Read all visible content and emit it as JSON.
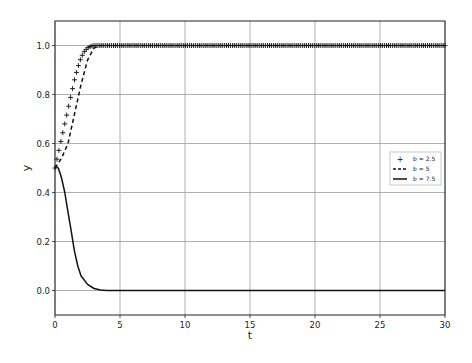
{
  "chart_data": {
    "type": "line",
    "title": "",
    "xlabel": "t",
    "ylabel": "y",
    "xlim": [
      0,
      30
    ],
    "ylim": [
      -0.1,
      1.1
    ],
    "grid": true,
    "x_ticks": [
      "0",
      "5",
      "10",
      "15",
      "20",
      "25",
      "30"
    ],
    "y_ticks": [
      "0.0",
      "0.2",
      "0.4",
      "0.6",
      "0.8",
      "1.0"
    ],
    "legend_position": "center right",
    "series": [
      {
        "name": "b = 2.5",
        "style": "plus-markers",
        "x": [
          0,
          0.25,
          0.5,
          0.75,
          1.0,
          1.25,
          1.5,
          1.75,
          2.0,
          2.25,
          2.5,
          2.75,
          3.0,
          3.5,
          4,
          5,
          10,
          15,
          20,
          25,
          30
        ],
        "y": [
          0.5,
          0.56,
          0.62,
          0.68,
          0.74,
          0.8,
          0.86,
          0.91,
          0.95,
          0.975,
          0.99,
          0.997,
          1.0,
          1.0,
          1.0,
          1.0,
          1.0,
          1.0,
          1.0,
          1.0,
          1.0
        ]
      },
      {
        "name": "b = 5",
        "style": "dashed",
        "x": [
          0,
          0.5,
          1.0,
          1.5,
          2.0,
          2.5,
          3.0,
          3.5,
          4,
          5,
          10,
          15,
          20,
          25,
          30
        ],
        "y": [
          0.5,
          0.54,
          0.6,
          0.72,
          0.84,
          0.94,
          0.99,
          1.0,
          1.0,
          1.0,
          1.0,
          1.0,
          1.0,
          1.0,
          1.0
        ]
      },
      {
        "name": "b = 7.5",
        "style": "solid",
        "x": [
          0,
          0.25,
          0.5,
          0.75,
          1.0,
          1.25,
          1.5,
          1.75,
          2.0,
          2.5,
          3.0,
          3.5,
          4.0,
          5,
          10,
          15,
          20,
          25,
          30
        ],
        "y": [
          0.51,
          0.5,
          0.46,
          0.4,
          0.32,
          0.24,
          0.16,
          0.1,
          0.06,
          0.025,
          0.008,
          0.002,
          0.0,
          0.0,
          0.0,
          0.0,
          0.0,
          0.0,
          0.0
        ]
      }
    ]
  }
}
